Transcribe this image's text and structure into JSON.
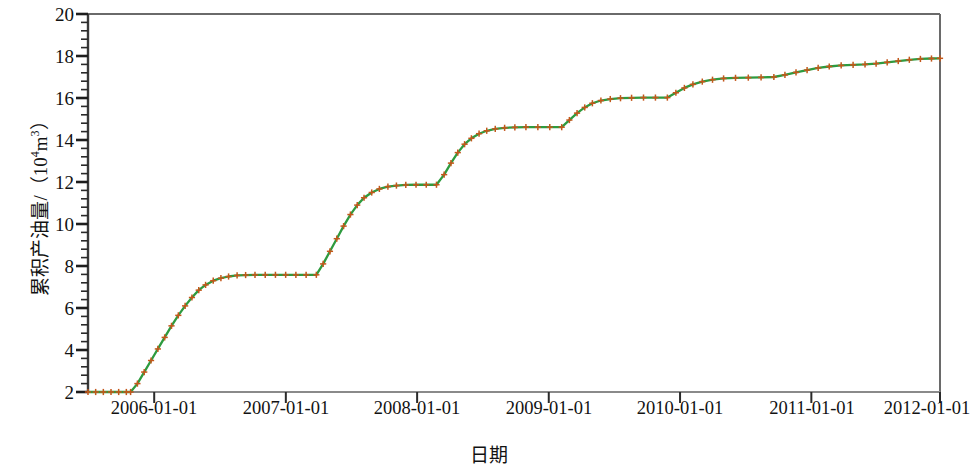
{
  "chart_data": {
    "type": "line",
    "title": "",
    "xlabel": "日期",
    "ylabel_main": "累积产油量/（10",
    "ylabel_sup": "4",
    "ylabel_tail": "m",
    "ylabel_sup2": "3",
    "ylabel_end": "）",
    "ylabel_full": "累积产油量/（10⁴m³）",
    "ylim": [
      2,
      20
    ],
    "ytick_values": [
      20,
      18,
      16,
      14,
      12,
      10,
      8,
      6,
      4,
      2
    ],
    "ytick_labels": [
      "20",
      "18",
      "16",
      "14",
      "12",
      "10",
      "8",
      "6",
      "4",
      "2"
    ],
    "y_minor_step": 0.4,
    "xlim": [
      "2005-06-15",
      "2012-01-01"
    ],
    "xtick_labels": [
      "2006-01-01",
      "2007-01-01",
      "2008-01-01",
      "2009-01-01",
      "2010-01-01",
      "2011-01-01",
      "2012-01-01"
    ],
    "xtick_positions": [
      0.0777,
      0.2322,
      0.3863,
      0.5408,
      0.6949,
      0.849,
      1.0
    ],
    "grid": false,
    "legend": null,
    "line_color": "#2e9b3f",
    "marker_color": "#c4571b",
    "marker_symbol": "plus",
    "axis_color": "#555555",
    "series": [
      {
        "name": "累积产油量",
        "marker": "+",
        "points_xfrac_yvalue": [
          [
            0.0,
            2.0
          ],
          [
            0.009,
            2.0
          ],
          [
            0.018,
            2.0
          ],
          [
            0.027,
            2.0
          ],
          [
            0.036,
            2.0
          ],
          [
            0.045,
            2.0
          ],
          [
            0.05,
            2.0
          ],
          [
            0.058,
            2.4
          ],
          [
            0.066,
            2.95
          ],
          [
            0.074,
            3.5
          ],
          [
            0.082,
            4.05
          ],
          [
            0.09,
            4.6
          ],
          [
            0.098,
            5.15
          ],
          [
            0.106,
            5.65
          ],
          [
            0.114,
            6.1
          ],
          [
            0.122,
            6.5
          ],
          [
            0.13,
            6.85
          ],
          [
            0.138,
            7.1
          ],
          [
            0.147,
            7.3
          ],
          [
            0.156,
            7.42
          ],
          [
            0.165,
            7.5
          ],
          [
            0.175,
            7.55
          ],
          [
            0.185,
            7.57
          ],
          [
            0.196,
            7.58
          ],
          [
            0.208,
            7.58
          ],
          [
            0.22,
            7.58
          ],
          [
            0.232,
            7.58
          ],
          [
            0.244,
            7.58
          ],
          [
            0.256,
            7.58
          ],
          [
            0.268,
            7.58
          ],
          [
            0.276,
            8.1
          ],
          [
            0.284,
            8.7
          ],
          [
            0.292,
            9.3
          ],
          [
            0.3,
            9.9
          ],
          [
            0.308,
            10.45
          ],
          [
            0.316,
            10.9
          ],
          [
            0.324,
            11.25
          ],
          [
            0.333,
            11.5
          ],
          [
            0.342,
            11.67
          ],
          [
            0.352,
            11.78
          ],
          [
            0.362,
            11.83
          ],
          [
            0.373,
            11.86
          ],
          [
            0.385,
            11.87
          ],
          [
            0.397,
            11.87
          ],
          [
            0.409,
            11.87
          ],
          [
            0.418,
            12.35
          ],
          [
            0.426,
            12.9
          ],
          [
            0.434,
            13.4
          ],
          [
            0.442,
            13.8
          ],
          [
            0.45,
            14.08
          ],
          [
            0.459,
            14.3
          ],
          [
            0.468,
            14.44
          ],
          [
            0.478,
            14.53
          ],
          [
            0.489,
            14.58
          ],
          [
            0.501,
            14.6
          ],
          [
            0.514,
            14.61
          ],
          [
            0.528,
            14.61
          ],
          [
            0.542,
            14.61
          ],
          [
            0.556,
            14.61
          ],
          [
            0.565,
            14.95
          ],
          [
            0.574,
            15.28
          ],
          [
            0.583,
            15.55
          ],
          [
            0.592,
            15.75
          ],
          [
            0.602,
            15.88
          ],
          [
            0.613,
            15.95
          ],
          [
            0.625,
            15.99
          ],
          [
            0.638,
            16.01
          ],
          [
            0.652,
            16.02
          ],
          [
            0.666,
            16.02
          ],
          [
            0.68,
            16.02
          ],
          [
            0.69,
            16.25
          ],
          [
            0.7,
            16.48
          ],
          [
            0.71,
            16.65
          ],
          [
            0.721,
            16.78
          ],
          [
            0.733,
            16.87
          ],
          [
            0.746,
            16.93
          ],
          [
            0.76,
            16.96
          ],
          [
            0.775,
            16.97
          ],
          [
            0.79,
            16.98
          ],
          [
            0.805,
            17.0
          ],
          [
            0.818,
            17.1
          ],
          [
            0.831,
            17.22
          ],
          [
            0.844,
            17.33
          ],
          [
            0.857,
            17.43
          ],
          [
            0.87,
            17.5
          ],
          [
            0.884,
            17.55
          ],
          [
            0.898,
            17.58
          ],
          [
            0.912,
            17.6
          ],
          [
            0.925,
            17.64
          ],
          [
            0.938,
            17.7
          ],
          [
            0.951,
            17.76
          ],
          [
            0.964,
            17.82
          ],
          [
            0.977,
            17.86
          ],
          [
            0.99,
            17.88
          ],
          [
            1.0,
            17.89
          ]
        ],
        "plateau_levels": [
          2.0,
          7.58,
          11.87,
          14.61,
          16.02,
          16.98,
          17.89
        ]
      }
    ]
  }
}
